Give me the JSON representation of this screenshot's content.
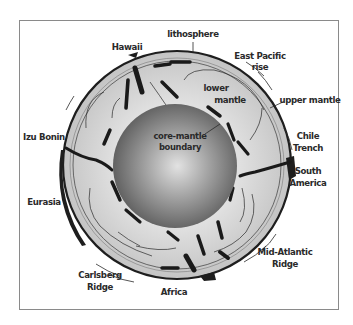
{
  "diagram": {
    "labels": {
      "lithosphere": "lithosphere",
      "hawaii": "Hawaii",
      "east_pacific_rise_1": "East Pacific",
      "east_pacific_rise_2": "rise",
      "lower_mantle_1": "lower",
      "lower_mantle_2": "mantle",
      "upper_mantle": "upper mantle",
      "core_mantle_1": "core-mantle",
      "core_mantle_2": "boundary",
      "izu_bonin": "Izu Bonin",
      "chile_trench_1": "Chile",
      "chile_trench_2": "Trench",
      "south_america_1": "South",
      "south_america_2": "America",
      "eurasia": "Eurasia",
      "mid_atlantic_1": "Mid-Atlantic",
      "mid_atlantic_2": "Ridge",
      "carlsberg_1": "Carlsberg",
      "carlsberg_2": "Ridge",
      "africa": "Africa"
    },
    "colors": {
      "mantle": "#cfcfcf",
      "mantle_inner": "#dedede",
      "core_center": "#d4d4d4",
      "core_edge": "#5e5e5e",
      "outline": "#1e1e1e",
      "slab": "#1a1a1a"
    }
  }
}
